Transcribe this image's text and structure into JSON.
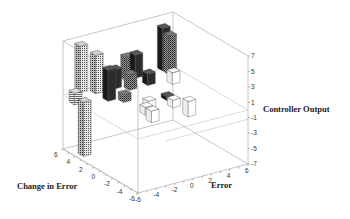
{
  "chart_data": {
    "type": "bar3d",
    "title": "",
    "xlabel": "Error",
    "ylabel": "Change in Error",
    "zlabel": "Controller Output",
    "x_ticks": [
      "-6",
      "-4",
      "-2",
      "0",
      "2",
      "4",
      "6"
    ],
    "y_ticks": [
      "-6",
      "-4",
      "-2",
      "0",
      "2",
      "4",
      "6"
    ],
    "z_ticks": [
      "7",
      "5",
      "3",
      "1",
      "-1",
      "-3",
      "-5",
      "-7"
    ],
    "xlim": [
      -6,
      6
    ],
    "ylim": [
      -6,
      6
    ],
    "zlim": [
      -7,
      7
    ],
    "grid": false,
    "bars": [
      {
        "x": -4,
        "y": 6,
        "z": 6.0,
        "fill": "hatch-light"
      },
      {
        "x": -3,
        "y": 5,
        "z": 5.0,
        "fill": "hatch-light"
      },
      {
        "x": -3,
        "y": 3,
        "z": 4.0,
        "fill": "dark"
      },
      {
        "x": -6,
        "y": 4,
        "z": 1.5,
        "fill": "stripe"
      },
      {
        "x": -5,
        "y": 4,
        "z": -7.0,
        "fill": "hatch-light"
      },
      {
        "x": -1,
        "y": 5,
        "z": 2.5,
        "fill": "dark"
      },
      {
        "x": 1,
        "y": 6,
        "z": 3.0,
        "fill": "hatch-mid"
      },
      {
        "x": 2,
        "y": 6,
        "z": 3.0,
        "fill": "dark"
      },
      {
        "x": 5,
        "y": 6,
        "z": 5.5,
        "fill": "dark"
      },
      {
        "x": 5,
        "y": 5,
        "z": 5.0,
        "fill": "hatch-mid"
      },
      {
        "x": 0,
        "y": 4,
        "z": 2.0,
        "fill": "hatch-mid"
      },
      {
        "x": 2,
        "y": 4,
        "z": 1.5,
        "fill": "dark"
      },
      {
        "x": 4,
        "y": 3,
        "z": 1.5,
        "fill": "white"
      },
      {
        "x": -2,
        "y": 2,
        "z": 1.0,
        "fill": "hatch-mid"
      },
      {
        "x": 0,
        "y": 1,
        "z": -1.0,
        "fill": "white"
      },
      {
        "x": -1,
        "y": 0,
        "z": -1.0,
        "fill": "white"
      },
      {
        "x": 2,
        "y": 1,
        "z": -0.5,
        "fill": "dark"
      },
      {
        "x": 2,
        "y": 0,
        "z": -1.0,
        "fill": "white"
      },
      {
        "x": 3,
        "y": -1,
        "z": -2.0,
        "fill": "white"
      },
      {
        "x": -1,
        "y": -1,
        "z": -1.5,
        "fill": "white"
      }
    ],
    "colors": {
      "box": "#b8b8b8",
      "text": "#222222",
      "dark": "#2a2a2a",
      "hatch_light": "#9a9a9a",
      "hatch_mid": "#6a6a6a",
      "white": "#ffffff"
    }
  },
  "labels": {
    "z_axis_title": "Controller Output",
    "x_axis_title": "Error",
    "y_axis_title": "Change in Error"
  }
}
